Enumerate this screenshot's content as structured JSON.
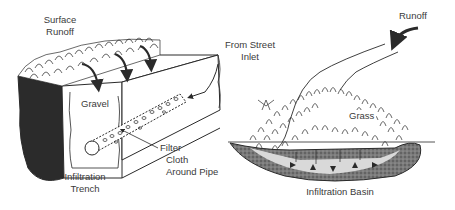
{
  "figure": {
    "panels": [
      {
        "id": "trench",
        "caption": [
          "Infiltration",
          "Trench"
        ],
        "labels": {
          "surface_runoff": [
            "Surface",
            "Runoff"
          ],
          "from_street_inlet": [
            "From Street",
            "Inlet"
          ],
          "gravel": "Gravel",
          "filter_cloth": [
            "Filter",
            "Cloth",
            "Around Pipe"
          ]
        }
      },
      {
        "id": "basin",
        "caption": [
          "Infiltration Basin"
        ],
        "labels": {
          "runoff": "Runoff",
          "grass": "Grass"
        }
      }
    ],
    "colors": {
      "line": "#2a2a2a",
      "text": "#3a3a3a",
      "soil_dark": "#2b2b2b",
      "soil_gray": "#6a6a6a",
      "background": "#ffffff"
    }
  }
}
